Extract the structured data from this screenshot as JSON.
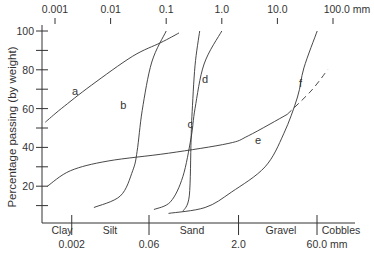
{
  "chart_data": {
    "type": "line",
    "title": "",
    "xscale": "log",
    "xlabel": "Particle size (mm)",
    "ylabel": "Percentage passing (by weight)",
    "ylim": [
      0,
      100
    ],
    "xlim": [
      0.00066,
      200
    ],
    "y_ticks": [
      100,
      80,
      60,
      40,
      20
    ],
    "y_minor_ticks": [
      90,
      70,
      50,
      30,
      10
    ],
    "top_ticks": [
      {
        "value": 0.001,
        "label": "0.001"
      },
      {
        "value": 0.01,
        "label": "0.01"
      },
      {
        "value": 0.1,
        "label": "0.1"
      },
      {
        "value": 1.0,
        "label": "1.0"
      },
      {
        "value": 10.0,
        "label": "10.0"
      },
      {
        "value": 100.0,
        "label": "100.0 mm"
      }
    ],
    "bottom_ticks": [
      {
        "value": 0.002,
        "label": "0.002"
      },
      {
        "value": 0.06,
        "label": "0.06"
      },
      {
        "value": 2.0,
        "label": "2.0"
      },
      {
        "value": 60.0,
        "label": "60.0 mm"
      }
    ],
    "size_classes": [
      {
        "label": "Clay",
        "from": 0.00066,
        "to": 0.002
      },
      {
        "label": "Silt",
        "from": 0.002,
        "to": 0.06
      },
      {
        "label": "Sand",
        "from": 0.06,
        "to": 2.0
      },
      {
        "label": "Gravel",
        "from": 2.0,
        "to": 60.0
      },
      {
        "label": "Cobbles",
        "from": 60.0,
        "to": 200
      }
    ],
    "series": [
      {
        "name": "a",
        "label_at": [
          0.0023,
          67
        ],
        "points": [
          [
            0.00067,
            53
          ],
          [
            0.0013,
            60
          ],
          [
            0.0045,
            72
          ],
          [
            0.025,
            87
          ],
          [
            0.08,
            94
          ],
          [
            0.17,
            99
          ]
        ]
      },
      {
        "name": "b",
        "label_at": [
          0.017,
          60
        ],
        "points": [
          [
            0.005,
            9
          ],
          [
            0.015,
            15
          ],
          [
            0.025,
            28
          ],
          [
            0.03,
            38
          ],
          [
            0.037,
            59
          ],
          [
            0.055,
            84
          ],
          [
            0.1,
            100
          ]
        ]
      },
      {
        "name": "c",
        "label_at": [
          0.27,
          50
        ],
        "points": [
          [
            0.2,
            7
          ],
          [
            0.26,
            15
          ],
          [
            0.28,
            44
          ],
          [
            0.29,
            56
          ],
          [
            0.33,
            82
          ],
          [
            0.4,
            100
          ]
        ]
      },
      {
        "name": "d",
        "label_at": [
          0.5,
          73
        ],
        "points": [
          [
            0.06,
            8
          ],
          [
            0.12,
            12
          ],
          [
            0.2,
            25
          ],
          [
            0.28,
            45
          ],
          [
            0.33,
            60
          ],
          [
            0.48,
            83
          ],
          [
            1.0,
            100
          ]
        ]
      },
      {
        "name": "e",
        "label_at": [
          4.5,
          42
        ],
        "points": [
          [
            0.00073,
            20
          ],
          [
            0.0019,
            28
          ],
          [
            0.009,
            33
          ],
          [
            0.11,
            37
          ],
          [
            1.3,
            42
          ],
          [
            3.0,
            46
          ],
          [
            15,
            57
          ]
        ]
      },
      {
        "name": "e-extrapolated",
        "dashed": true,
        "points": [
          [
            15,
            57
          ],
          [
            40,
            69
          ],
          [
            80,
            80
          ]
        ]
      },
      {
        "name": "f",
        "label_at": [
          26,
          71
        ],
        "points": [
          [
            0.11,
            6
          ],
          [
            0.5,
            9
          ],
          [
            1.5,
            17
          ],
          [
            6,
            30
          ],
          [
            13,
            47
          ],
          [
            23,
            66
          ],
          [
            30,
            81
          ],
          [
            52,
            100
          ]
        ]
      }
    ]
  }
}
